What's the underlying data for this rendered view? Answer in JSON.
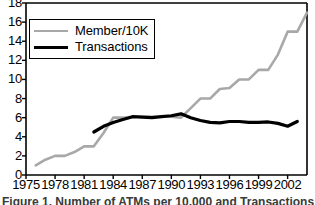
{
  "chart_data": {
    "type": "line",
    "title": "",
    "xlabel": "",
    "ylabel": "",
    "xlim": [
      1975,
      2004
    ],
    "ylim": [
      0,
      18
    ],
    "ytick_values": [
      18,
      16,
      14,
      12,
      10,
      8,
      6,
      4,
      2,
      0
    ],
    "ytick_labels": [
      "18",
      "16",
      "14",
      "12",
      "10",
      "8",
      "6",
      "4",
      "2",
      "0"
    ],
    "xtick_values": [
      1975,
      1978,
      1981,
      1984,
      1987,
      1990,
      1993,
      1996,
      1999,
      2002
    ],
    "xtick_labels": [
      "1975",
      "1978",
      "1981",
      "1984",
      "1987",
      "1990",
      "1993",
      "1996",
      "1999",
      "2002"
    ],
    "grid": false,
    "legend_position": "upper left",
    "series": [
      {
        "name": "Member/10K",
        "color": "#a8a8a8",
        "x": [
          1976,
          1977,
          1978,
          1979,
          1980,
          1981,
          1982,
          1983,
          1984,
          1985,
          1986,
          1987,
          1988,
          1989,
          1990,
          1991,
          1992,
          1993,
          1994,
          1995,
          1996,
          1997,
          1998,
          1999,
          2000,
          2001,
          2002,
          2003,
          2004
        ],
        "values": [
          1.0,
          1.6,
          2.0,
          2.0,
          2.4,
          3.0,
          3.0,
          4.4,
          6.0,
          6.0,
          6.1,
          6.1,
          6.1,
          6.1,
          6.1,
          6.0,
          7.0,
          8.0,
          8.0,
          9.0,
          9.1,
          10.0,
          10.0,
          11.0,
          11.0,
          12.6,
          15.0,
          15.0,
          17.0
        ]
      },
      {
        "name": "Transactions",
        "color": "#000000",
        "x": [
          1982,
          1983,
          1984,
          1985,
          1986,
          1987,
          1988,
          1989,
          1990,
          1991,
          1992,
          1993,
          1994,
          1995,
          1996,
          1997,
          1998,
          1999,
          2000,
          2001,
          2002,
          2003
        ],
        "values": [
          4.5,
          5.1,
          5.5,
          5.8,
          6.1,
          6.05,
          6.0,
          6.1,
          6.2,
          6.4,
          6.0,
          5.7,
          5.5,
          5.45,
          5.6,
          5.6,
          5.5,
          5.5,
          5.55,
          5.4,
          5.1,
          5.6
        ]
      }
    ]
  },
  "legend": {
    "items": [
      {
        "label": "Member/10K",
        "style": "member"
      },
      {
        "label": "Transactions",
        "style": "transactions"
      }
    ]
  },
  "caption": {
    "text": "Figure 1. Number of ATMs per 10,000 and Transactions"
  }
}
